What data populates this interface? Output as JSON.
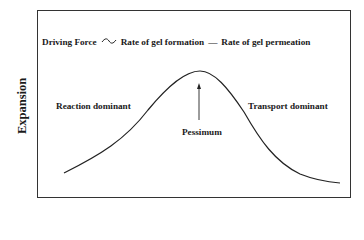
{
  "diagram": {
    "y_axis_label": "Expansion",
    "formula": {
      "lhs": "Driving Force",
      "proportional_symbol": "~",
      "term1": "Rate of gel formation",
      "minus_symbol": "—",
      "term2": "Rate of gel permeation"
    },
    "regions": {
      "left": "Reaction dominant",
      "right": "Transport dominant"
    },
    "peak_label": "Pessimum",
    "curve_shape": "bell-shaped (asymmetric, skewed right)",
    "line_color": "#222222"
  }
}
